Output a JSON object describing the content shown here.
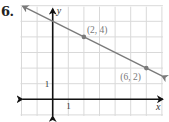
{
  "problem": {
    "number": "6."
  },
  "graph": {
    "origin_px": [
      52.7,
      99.3
    ],
    "unit_px": 15.6,
    "grid": {
      "x_min": -2,
      "x_max": 7,
      "y_min": -1,
      "y_max": 6,
      "color": "#d9d9d9"
    },
    "axis_color": "#111111",
    "axis_labels": {
      "x": "x",
      "y": "y"
    },
    "tick_labels": {
      "x_one": "1",
      "y_one": "1"
    },
    "line": {
      "color": "#7a7a7a",
      "slope": -0.5,
      "intercept": 5,
      "from": [
        -2,
        6
      ],
      "to": [
        7,
        1.5
      ]
    },
    "points": [
      {
        "x": 2,
        "y": 4,
        "label": "(2, 4)"
      },
      {
        "x": 6,
        "y": 2,
        "label": "(6, 2)"
      }
    ],
    "label_color": "#777777"
  },
  "chart_data": {
    "type": "line",
    "title": "6.",
    "xlabel": "x",
    "ylabel": "y",
    "xlim": [
      -2,
      7
    ],
    "ylim": [
      -1,
      6
    ],
    "grid": true,
    "series": [
      {
        "name": "line through (2, 4) and (6, 2)",
        "x": [
          -2,
          2,
          6,
          7
        ],
        "y": [
          6,
          4,
          2,
          1.5
        ]
      }
    ],
    "points": [
      {
        "x": 2,
        "y": 4,
        "label": "(2, 4)"
      },
      {
        "x": 6,
        "y": 2,
        "label": "(6, 2)"
      }
    ],
    "tick_labels": {
      "x": [
        "1"
      ],
      "y": [
        "1"
      ]
    }
  }
}
